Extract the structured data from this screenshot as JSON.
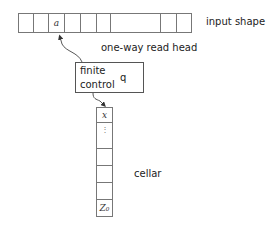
{
  "diagram": {
    "tape": {
      "label": "input shape",
      "cells": [
        {
          "x": 0,
          "w": 15,
          "text": ""
        },
        {
          "x": 15,
          "w": 15,
          "text": ""
        },
        {
          "x": 30,
          "w": 16,
          "text": "a"
        },
        {
          "x": 46,
          "w": 16,
          "text": ""
        },
        {
          "x": 62,
          "w": 16,
          "text": ""
        },
        {
          "x": 78,
          "w": 14,
          "text": ""
        },
        {
          "x": 92,
          "w": 50,
          "text": ""
        },
        {
          "x": 142,
          "w": 16,
          "text": ""
        },
        {
          "x": 158,
          "w": 15,
          "text": ""
        }
      ]
    },
    "read_head_label": "one-way read head",
    "finite_control": {
      "line1": "finite",
      "line2": "control",
      "state": "q"
    },
    "cellar": {
      "label": "cellar",
      "cells": [
        {
          "y": 0,
          "h": 15,
          "text": "x"
        },
        {
          "y": 15,
          "h": 26,
          "text": "⋮"
        },
        {
          "y": 41,
          "h": 17,
          "text": ""
        },
        {
          "y": 58,
          "h": 17,
          "text": ""
        },
        {
          "y": 75,
          "h": 17,
          "text": ""
        },
        {
          "y": 92,
          "h": 17,
          "text": "Z₀"
        }
      ]
    }
  }
}
